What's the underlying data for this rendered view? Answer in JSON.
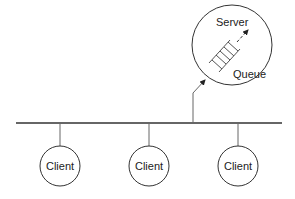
{
  "diagram": {
    "type": "client-server-bus",
    "server": {
      "label": "Server",
      "queue_label": "Queue"
    },
    "clients": [
      {
        "label": "Client"
      },
      {
        "label": "Client"
      },
      {
        "label": "Client"
      }
    ],
    "colors": {
      "stroke": "#333333",
      "background": "#ffffff",
      "text": "#222222"
    }
  }
}
